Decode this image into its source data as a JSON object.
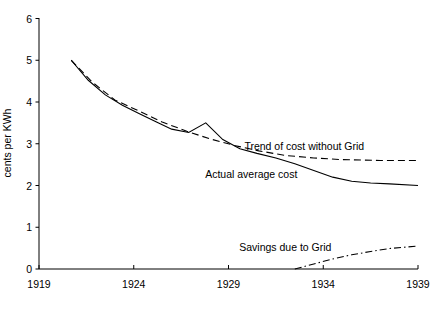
{
  "chart_data": {
    "type": "line",
    "title": "",
    "xlabel": "",
    "ylabel": "cents per KWh",
    "xlim": [
      1919,
      1939
    ],
    "ylim": [
      0,
      6
    ],
    "xticks": [
      1919,
      1924,
      1929,
      1934,
      1939
    ],
    "yticks": [
      0,
      1,
      2,
      3,
      4,
      5,
      6
    ],
    "xtick_labels": [
      "1919",
      "1924",
      "1929",
      "1934",
      "1939"
    ],
    "ytick_labels": [
      "0",
      "1",
      "2",
      "3",
      "4",
      "5",
      "6"
    ],
    "grid": false,
    "legend": "none",
    "annotations": [
      {
        "name": "trend-label",
        "text": "Trend of cost without Grid",
        "x": 1933.0,
        "y": 2.95
      },
      {
        "name": "actual-label",
        "text": "Actual average cost",
        "x": 1930.2,
        "y": 2.28
      },
      {
        "name": "savings-label",
        "text": "Savings due to Grid",
        "x": 1932.0,
        "y": 0.52
      }
    ],
    "series": [
      {
        "name": "Actual average cost",
        "style": "solid",
        "color": "#000000",
        "points": [
          {
            "x": 1920.7,
            "y": 5.0
          },
          {
            "x": 1921.6,
            "y": 4.52
          },
          {
            "x": 1922.5,
            "y": 4.17
          },
          {
            "x": 1923.4,
            "y": 3.92
          },
          {
            "x": 1924.3,
            "y": 3.72
          },
          {
            "x": 1925.2,
            "y": 3.52
          },
          {
            "x": 1926.0,
            "y": 3.35
          },
          {
            "x": 1926.9,
            "y": 3.27
          },
          {
            "x": 1927.8,
            "y": 3.5
          },
          {
            "x": 1928.7,
            "y": 3.1
          },
          {
            "x": 1929.6,
            "y": 2.88
          },
          {
            "x": 1930.5,
            "y": 2.77
          },
          {
            "x": 1931.5,
            "y": 2.66
          },
          {
            "x": 1932.5,
            "y": 2.52
          },
          {
            "x": 1933.5,
            "y": 2.36
          },
          {
            "x": 1934.5,
            "y": 2.2
          },
          {
            "x": 1935.5,
            "y": 2.1
          },
          {
            "x": 1936.5,
            "y": 2.06
          },
          {
            "x": 1937.5,
            "y": 2.04
          },
          {
            "x": 1939.0,
            "y": 2.0
          }
        ]
      },
      {
        "name": "Trend of cost without Grid",
        "style": "dashed",
        "color": "#000000",
        "points": [
          {
            "x": 1920.7,
            "y": 5.0
          },
          {
            "x": 1921.8,
            "y": 4.48
          },
          {
            "x": 1923.0,
            "y": 4.05
          },
          {
            "x": 1924.3,
            "y": 3.78
          },
          {
            "x": 1925.5,
            "y": 3.52
          },
          {
            "x": 1926.8,
            "y": 3.3
          },
          {
            "x": 1928.0,
            "y": 3.12
          },
          {
            "x": 1929.3,
            "y": 2.96
          },
          {
            "x": 1930.6,
            "y": 2.83
          },
          {
            "x": 1932.0,
            "y": 2.72
          },
          {
            "x": 1933.5,
            "y": 2.66
          },
          {
            "x": 1935.0,
            "y": 2.62
          },
          {
            "x": 1937.0,
            "y": 2.6
          },
          {
            "x": 1939.0,
            "y": 2.6
          }
        ]
      },
      {
        "name": "Savings due to Grid",
        "style": "dash-dot",
        "color": "#000000",
        "points": [
          {
            "x": 1932.5,
            "y": 0.0
          },
          {
            "x": 1933.5,
            "y": 0.12
          },
          {
            "x": 1934.5,
            "y": 0.24
          },
          {
            "x": 1935.5,
            "y": 0.34
          },
          {
            "x": 1936.5,
            "y": 0.42
          },
          {
            "x": 1937.5,
            "y": 0.49
          },
          {
            "x": 1939.0,
            "y": 0.55
          }
        ]
      }
    ]
  },
  "axes": {
    "y_axis_title": "cents per KWh"
  }
}
